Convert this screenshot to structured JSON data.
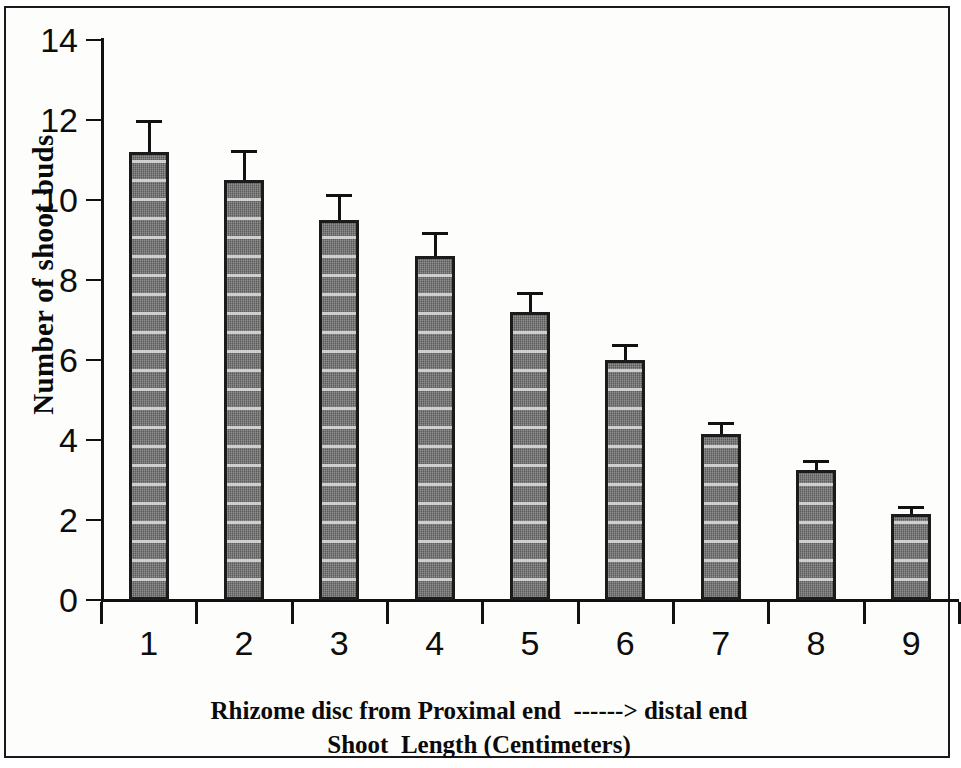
{
  "chart_data": {
    "type": "bar",
    "title": "",
    "subtitle": "",
    "xlabel_line1": "Rhizome disc from Proximal end  ------> distal end",
    "xlabel_line2": "Shoot  Length (Centimeters)",
    "ylabel": "Number of shoot buds",
    "categories": [
      "1",
      "2",
      "3",
      "4",
      "5",
      "6",
      "7",
      "8",
      "9"
    ],
    "values": [
      11.2,
      10.5,
      9.5,
      8.6,
      7.2,
      6.0,
      4.15,
      3.25,
      2.15
    ],
    "error_upper": [
      0.8,
      0.75,
      0.65,
      0.6,
      0.5,
      0.4,
      0.3,
      0.25,
      0.2
    ],
    "error_lower": [
      0,
      0,
      0,
      0,
      0,
      0,
      0,
      0,
      0
    ],
    "ylim": [
      0,
      14
    ],
    "ytick_values": [
      0,
      2,
      4,
      6,
      8,
      10,
      12,
      14
    ],
    "ytick_labels": [
      "0",
      "2",
      "4",
      "6",
      "8",
      "10",
      "12",
      "14"
    ],
    "xlim": [
      0,
      9
    ],
    "grid": false,
    "legend": null,
    "bar_color": "#6f6f6f",
    "bar_edge_color": "#1b1b1b",
    "axis_color": "#111111",
    "background_color": "#ffffff"
  }
}
